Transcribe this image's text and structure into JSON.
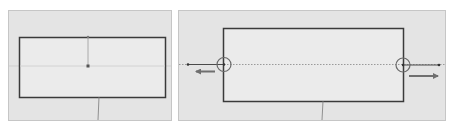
{
  "figure": {
    "width": 456,
    "height": 130,
    "colors": {
      "background": "#ffffff",
      "panel_fill": "#e4e4e4",
      "panel_border": "#c6c6c6",
      "rect_fill": "#ebebeb",
      "rect_stroke": "#3a3a3a",
      "guide_line": "#b4b4b4",
      "dotted_line": "#9a9a9a",
      "circle_stroke": "#6a6a6a",
      "arrow_color": "#6f6f6f"
    },
    "panels": [
      {
        "id": "before",
        "x": 8,
        "y": 10,
        "w": 164,
        "h": 111,
        "rect": {
          "x": 19,
          "y": 37,
          "w": 146,
          "h": 60
        },
        "center_point": {
          "x": 88,
          "y": 66
        },
        "vertical_guide": {
          "x": 88,
          "y1": 37,
          "y2": 66
        },
        "horizontal_guide_y": 66,
        "below_line": {
          "x1": 99,
          "y1": 97,
          "x2": 98,
          "y2": 120
        }
      },
      {
        "id": "after",
        "x": 178,
        "y": 10,
        "w": 268,
        "h": 111,
        "rect": {
          "x": 223,
          "y": 28,
          "w": 180,
          "h": 73
        },
        "dotted_line_y": 64,
        "handles": [
          {
            "side": "left",
            "cx": 224,
            "cy": 64,
            "r": 7,
            "line_to_x": 188,
            "arrow": {
              "x1": 215,
              "x2": 195,
              "y": 71,
              "direction": "left"
            }
          },
          {
            "side": "right",
            "cx": 403,
            "cy": 65,
            "r": 7,
            "line_to_x": 440,
            "arrow": {
              "x1": 409,
              "x2": 440,
              "y": 76,
              "direction": "right"
            }
          }
        ],
        "below_line": {
          "x1": 323,
          "y1": 101,
          "x2": 322,
          "y2": 120
        }
      }
    ]
  }
}
